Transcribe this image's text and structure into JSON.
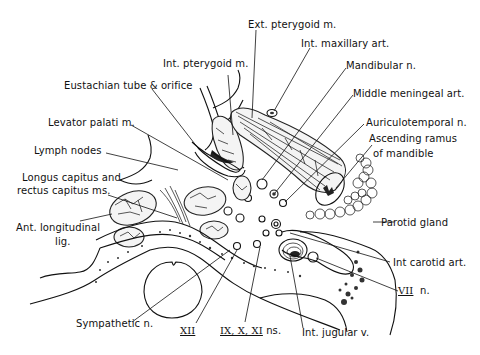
{
  "figure": {
    "type": "anatomical cross-section diagram",
    "background": "#ffffff",
    "ink_color": "#111111"
  },
  "labels": {
    "ext_pterygoid": "Ext. pterygoid m.",
    "int_maxillary": "Int. maxillary art.",
    "int_pterygoid": "Int. pterygoid m.",
    "mandibular": "Mandibular n.",
    "eustachian": "Eustachian tube & orifice",
    "middle_meningeal": "Middle meningeal art.",
    "levator_palati": "Levator palati m.",
    "auriculotemporal": "Auriculotemporal n.",
    "ascending_ramus_1": "Ascending ramus",
    "ascending_ramus_2": "of mandible",
    "lymph_nodes": "Lymph nodes",
    "longus_1": "Longus capitus and",
    "longus_2": "rectus capitus ms.",
    "parotid": "Parotid gland",
    "ant_long_1": "Ant. longitudinal",
    "ant_long_2": "lig.",
    "int_carotid": "Int carotid art.",
    "vii_numeral": "VII",
    "vii_suffix": "n.",
    "sympathetic": "Sympathetic n.",
    "xii_numeral": "XII",
    "ix_x_xi_numerals": "IX, X, XI",
    "ix_x_xi_suffix": "ns.",
    "int_jugular": "Int. jugular v."
  }
}
